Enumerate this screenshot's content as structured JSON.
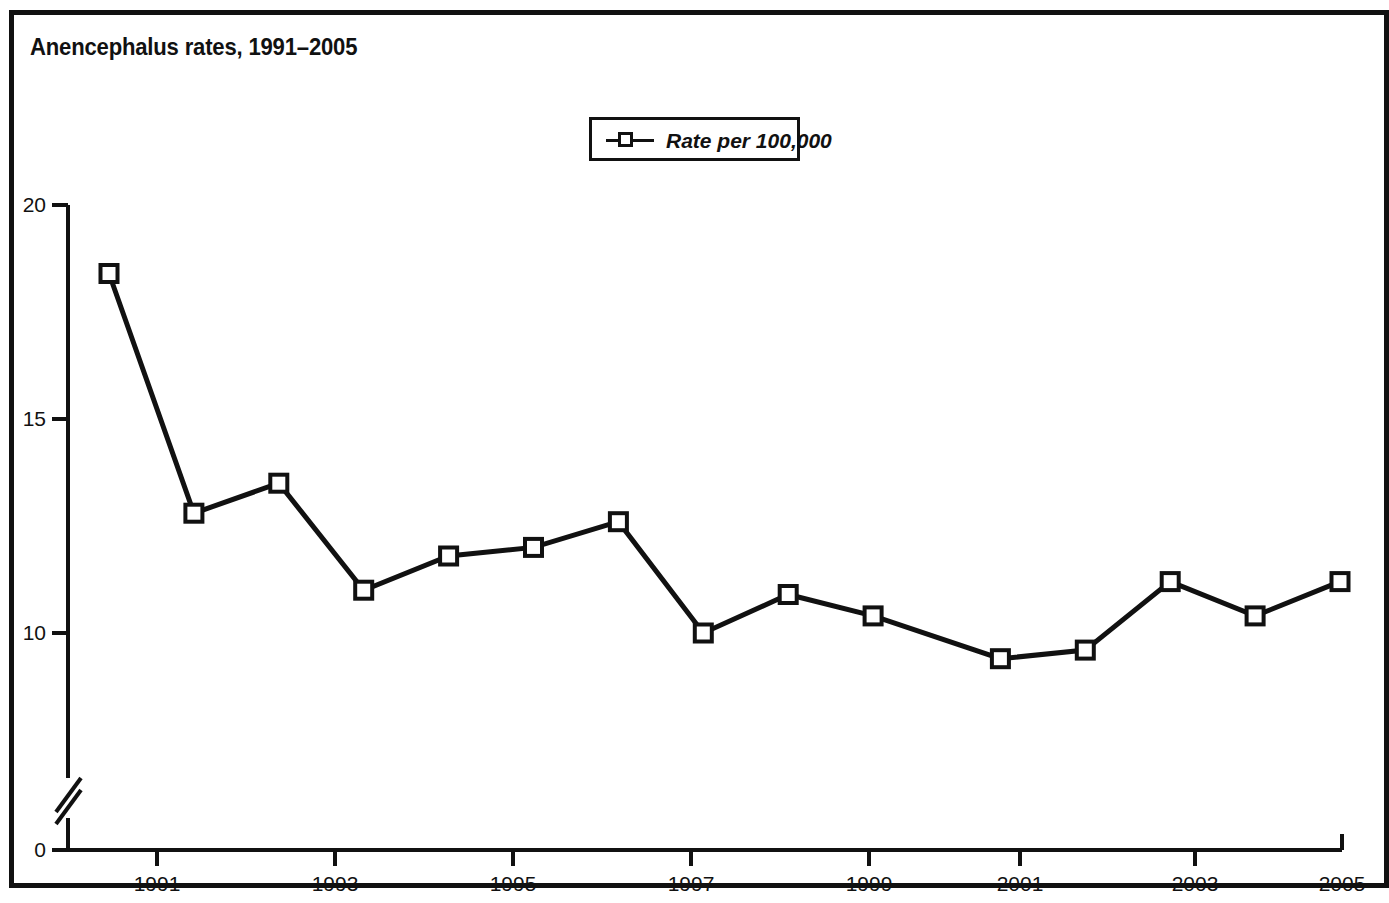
{
  "figure": {
    "title": "Anencephalus rates, 1991–2005",
    "border_color": "#111111",
    "background": "#ffffff"
  },
  "legend": {
    "entries": [
      {
        "label": "Rate per 100,000",
        "marker": "open-square",
        "color": "#111111"
      }
    ],
    "position": "top-center"
  },
  "axes": {
    "y_ticks": [
      "20",
      "15",
      "10",
      "0"
    ],
    "x_ticks": [
      "1991",
      "1993",
      "1995",
      "1997",
      "1999",
      "2001",
      "2003",
      "2005"
    ],
    "y_axis_break": true,
    "grid": false
  },
  "chart_data": {
    "type": "line",
    "title": "Anencephalus rates, 1991–2005",
    "xlabel": "",
    "ylabel": "",
    "ylim": [
      0,
      20
    ],
    "xlim": [
      1990.5,
      2005
    ],
    "grid": false,
    "legend_position": "top-center",
    "axis_break_y": true,
    "x": [
      1990.5,
      1991.5,
      1992.5,
      1993.5,
      1994.5,
      1995.5,
      1996.5,
      1997.5,
      1998.5,
      1999.5,
      2001,
      2002,
      2003,
      2004,
      2005
    ],
    "categories": [
      "1990.5",
      "1991.5",
      "1992.5",
      "1993.5",
      "1994.5",
      "1995.5",
      "1996.5",
      "1997.5",
      "1998.5",
      "1999.5",
      "2001",
      "2002",
      "2003",
      "2004",
      "2005"
    ],
    "series": [
      {
        "name": "Rate per 100,000",
        "marker": "open-square",
        "color": "#111111",
        "values": [
          18.4,
          12.8,
          13.5,
          11.0,
          11.8,
          12.0,
          12.6,
          10.0,
          10.9,
          10.4,
          9.4,
          9.6,
          11.2,
          10.4,
          11.2
        ]
      }
    ],
    "y_tick_values": [
      20,
      15,
      10,
      0
    ],
    "x_tick_values": [
      1991,
      1993,
      1995,
      1997,
      1999,
      2001,
      2003,
      2005
    ]
  }
}
